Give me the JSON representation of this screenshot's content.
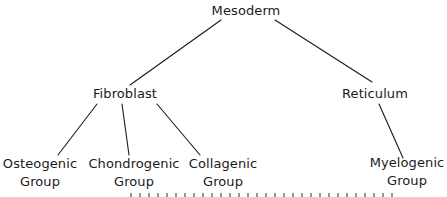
{
  "diagram": {
    "type": "tree",
    "colors": {
      "line": "#1a1a1a",
      "text": "#1a1a1a",
      "background": "#ffffff"
    },
    "nodes": {
      "mesoderm": {
        "label": "Mesoderm"
      },
      "fibroblast": {
        "label": "Fibroblast"
      },
      "reticulum": {
        "label": "Reticulum"
      },
      "osteogenic": {
        "line1": "Osteogenic",
        "line2": "Group"
      },
      "chondrogenic": {
        "line1": "Chondrogenic",
        "line2": "Group"
      },
      "collagenic": {
        "line1": "Collagenic",
        "line2": "Group"
      },
      "myelogenic": {
        "line1": "Myelogenic",
        "line2": "Group"
      }
    },
    "edges": [
      {
        "from": "Mesoderm",
        "to": "Fibroblast"
      },
      {
        "from": "Mesoderm",
        "to": "Reticulum"
      },
      {
        "from": "Fibroblast",
        "to": "Osteogenic Group"
      },
      {
        "from": "Fibroblast",
        "to": "Chondrogenic Group"
      },
      {
        "from": "Fibroblast",
        "to": "Collagenic Group"
      },
      {
        "from": "Reticulum",
        "to": "Myelogenic Group"
      }
    ]
  }
}
